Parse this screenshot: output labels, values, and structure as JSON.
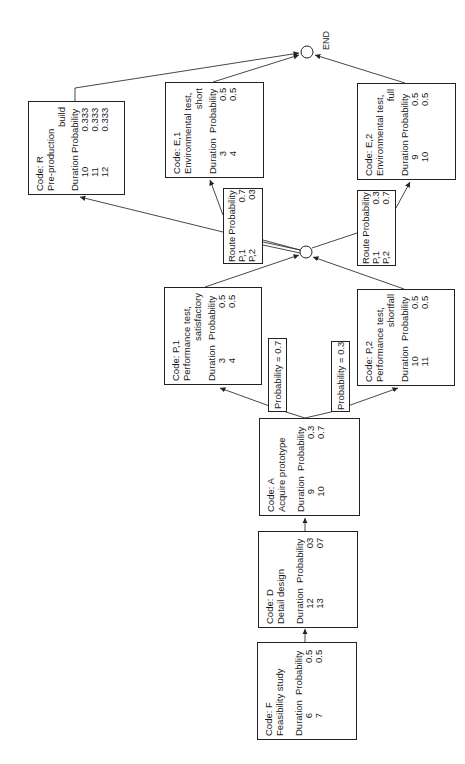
{
  "diagram": {
    "type": "probabilistic-activity-network",
    "orientation": "rotated-90-ccw",
    "end_label": "END",
    "column_headers": {
      "duration": "Duration",
      "probability": "Probability"
    },
    "route_headers": {
      "route": "Route",
      "probability": "Probability"
    },
    "nodes": {
      "F": {
        "code": "Code: F",
        "title": "Feasibility study",
        "title2": "",
        "rows": [
          {
            "duration": "6",
            "probability": "0.5"
          },
          {
            "duration": "7",
            "probability": "0.5"
          }
        ]
      },
      "D": {
        "code": "Code: D",
        "title": "Detail design",
        "title2": "",
        "rows": [
          {
            "duration": "12",
            "probability": "03"
          },
          {
            "duration": "13",
            "probability": "07"
          }
        ]
      },
      "A": {
        "code": "Code: A",
        "title": "Acquire prototype",
        "title2": "",
        "rows": [
          {
            "duration": "9",
            "probability": "0.3"
          },
          {
            "duration": "10",
            "probability": "0.7"
          }
        ]
      },
      "P1": {
        "code": "Code: P,1",
        "title": "Performance test,",
        "title2": "satisfactory",
        "rows": [
          {
            "duration": "3",
            "probability": "0.5"
          },
          {
            "duration": "4",
            "probability": "0.5"
          }
        ]
      },
      "P2": {
        "code": "Code: P,2",
        "title": "Performance test,",
        "title2": "shortfall",
        "rows": [
          {
            "duration": "10",
            "probability": "0.5"
          },
          {
            "duration": "11",
            "probability": "0.5"
          }
        ]
      },
      "E1": {
        "code": "Code: E,1",
        "title": "Environmental test,",
        "title2": "short",
        "rows": [
          {
            "duration": "3",
            "probability": "0.5"
          },
          {
            "duration": "4",
            "probability": "0.5"
          }
        ]
      },
      "E2": {
        "code": "Code: E,2",
        "title": "Environmental test,",
        "title2": "full",
        "rows": [
          {
            "duration": "9",
            "probability": "0.5"
          },
          {
            "duration": "10",
            "probability": "0.5"
          }
        ]
      },
      "R": {
        "code": "Code: R",
        "title": "Pre-production",
        "title2": "build",
        "rows": [
          {
            "duration": "10",
            "probability": "0.333"
          },
          {
            "duration": "11",
            "probability": "0.333"
          },
          {
            "duration": "12",
            "probability": "0.333"
          }
        ]
      }
    },
    "branch_labels": {
      "to_P1": "Probability = 0.7",
      "to_P2": "Probability = 0.3"
    },
    "route_tables": {
      "to_E1": {
        "rows": [
          {
            "route": "P,1",
            "probability": "0.7"
          },
          {
            "route": "P,2",
            "probability": "03"
          }
        ]
      },
      "to_E2": {
        "rows": [
          {
            "route": "P,1",
            "probability": "0.3"
          },
          {
            "route": "P,2",
            "probability": "0.7"
          }
        ]
      }
    },
    "edges": [
      [
        "F",
        "D"
      ],
      [
        "D",
        "A"
      ],
      [
        "A",
        "P1"
      ],
      [
        "A",
        "P2"
      ],
      [
        "P1",
        "merge"
      ],
      [
        "P2",
        "merge"
      ],
      [
        "merge",
        "R"
      ],
      [
        "merge",
        "E1"
      ],
      [
        "merge",
        "E2"
      ],
      [
        "R",
        "END"
      ],
      [
        "E1",
        "END"
      ],
      [
        "E2",
        "END"
      ]
    ],
    "colors": {
      "line": "#222222",
      "background": "#ffffff"
    }
  }
}
